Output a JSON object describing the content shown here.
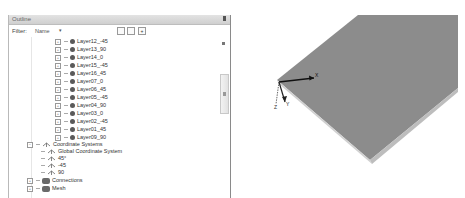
{
  "outline": {
    "title": "Outline",
    "filter_label": "Filter:",
    "filter_value": "Name",
    "filter_arrow": "▾",
    "toolbar_buttons": [
      "expand-all",
      "collapse-all",
      "add"
    ],
    "layers": [
      {
        "label": "Layer12_-45"
      },
      {
        "label": "Layer13_90"
      },
      {
        "label": "Layer14_0"
      },
      {
        "label": "Layer15_-45"
      },
      {
        "label": "Layer16_45"
      },
      {
        "label": "Layer07_0"
      },
      {
        "label": "Layer06_45"
      },
      {
        "label": "Layer05_-45"
      },
      {
        "label": "Layer04_90"
      },
      {
        "label": "Layer03_0"
      },
      {
        "label": "Layer02_-45"
      },
      {
        "label": "Layer01_45"
      },
      {
        "label": "Layer09_90"
      }
    ],
    "coordinate_systems": {
      "label": "Coordinate Systems",
      "expander": "−",
      "children": [
        {
          "label": "Global Coordinate System"
        },
        {
          "label": "45°"
        },
        {
          "label": "-45"
        },
        {
          "label": "90"
        }
      ]
    },
    "connections": {
      "label": "Connections",
      "expander": "+"
    },
    "mesh": {
      "label": "Mesh",
      "expander": "+"
    },
    "expander_plus": "+"
  },
  "viewport": {
    "axis_labels": {
      "x": "X",
      "y": "Y",
      "z": "Z"
    },
    "plate_color": "#8c8c8c",
    "edge_color": "#c9c9c9"
  }
}
